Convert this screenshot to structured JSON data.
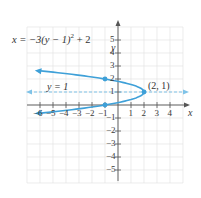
{
  "chart_data": {
    "type": "line",
    "title": "",
    "xlabel": "x",
    "ylabel": "y",
    "xlim": [
      -7,
      5
    ],
    "ylim": [
      -6,
      6
    ],
    "grid": true,
    "x_ticks": [
      -6,
      -5,
      -4,
      -3,
      -2,
      -1,
      1,
      2,
      3,
      4
    ],
    "y_ticks": [
      -5,
      -4,
      -3,
      -2,
      -1,
      1,
      2,
      3,
      4,
      5
    ],
    "x_tick_labels": [
      "-6",
      "-5",
      "-4",
      "-3",
      "-2",
      "-1",
      "1",
      "2",
      "3",
      "4"
    ],
    "y_tick_labels": [
      "-5",
      "-4",
      "-3",
      "-2",
      "-1",
      "1",
      "2",
      "3",
      "4",
      "5"
    ],
    "series": [
      {
        "name": "x = -3(y - 1)^2 + 2",
        "kind": "parabola-horizontal",
        "equation": "x = -3(y - 1)^2 + 2",
        "y_range": [
          -0.65,
          2.65
        ],
        "points": [
          {
            "x": -6.2,
            "y": 2.63
          },
          {
            "x": -1,
            "y": 2
          },
          {
            "x": 2,
            "y": 1
          },
          {
            "x": -1,
            "y": 0
          },
          {
            "x": -6.2,
            "y": -0.63
          }
        ],
        "color": "#3ea0d8"
      },
      {
        "name": "y = 1",
        "kind": "axis-of-symmetry",
        "style": "dashed",
        "y": 1,
        "color": "#7fc3e8"
      }
    ],
    "marked_points": [
      {
        "x": 2,
        "y": 1,
        "label": "(2, 1)"
      },
      {
        "x": -1,
        "y": 2,
        "label": ""
      },
      {
        "x": -1,
        "y": 0,
        "label": ""
      }
    ],
    "annotations": [
      {
        "text": "x = −3(y − 1)² + 2"
      },
      {
        "text": "y = 1"
      },
      {
        "text": "(2, 1)"
      }
    ]
  },
  "labels": {
    "equation_main": "x = −3(y − 1)",
    "equation_exp": "2",
    "equation_tail": " + 2",
    "axis_line_label": "y = 1",
    "vertex_label": "(2, 1)",
    "x_axis_label": "x",
    "y_axis_label": "y"
  },
  "colors": {
    "curve": "#3ea0d8",
    "dashed": "#7fc3e8",
    "grid": "#e4e4e4",
    "axis": "#555555"
  }
}
